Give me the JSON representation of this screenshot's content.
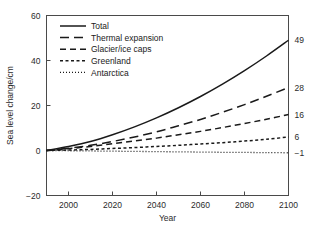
{
  "chart_data": {
    "type": "line",
    "title": "",
    "xlabel": "Year",
    "ylabel": "Sea level change/cm",
    "xlim": [
      1990,
      2100
    ],
    "ylim": [
      -20,
      60
    ],
    "grid": false,
    "legend_position": "top-left",
    "xticks": [
      2000,
      2020,
      2040,
      2060,
      2080,
      2100
    ],
    "yticks": [
      -20,
      0,
      20,
      40,
      60
    ],
    "xtick_labels": [
      "2000",
      "2020",
      "2040",
      "2060",
      "2080",
      "2100"
    ],
    "ytick_labels": [
      "-20",
      "0",
      "20",
      "40",
      "60"
    ],
    "x": [
      1990,
      2000,
      2010,
      2020,
      2030,
      2040,
      2050,
      2060,
      2070,
      2080,
      2090,
      2100
    ],
    "series": [
      {
        "name": "Total",
        "style": "solid",
        "dash": "none",
        "end_label": "49",
        "values": [
          0,
          1.8,
          4.0,
          7.0,
          10.5,
          14.5,
          19.0,
          24.0,
          29.5,
          35.5,
          42.0,
          49.0
        ]
      },
      {
        "name": "Thermal expansion",
        "style": "long-dash",
        "dash": "9,5",
        "end_label": "28",
        "values": [
          0,
          1.0,
          2.3,
          4.0,
          6.0,
          8.3,
          11.0,
          13.8,
          17.0,
          20.4,
          24.1,
          28.0
        ]
      },
      {
        "name": "Glacier/ice caps",
        "style": "medium-dash",
        "dash": "6,4",
        "end_label": "16",
        "values": [
          0,
          0.8,
          1.8,
          3.0,
          4.2,
          5.5,
          7.0,
          8.5,
          10.2,
          12.0,
          13.9,
          16.0
        ]
      },
      {
        "name": "Greenland",
        "style": "short-dash",
        "dash": "3,2.5",
        "end_label": "6",
        "values": [
          0,
          0.2,
          0.5,
          0.9,
          1.3,
          1.8,
          2.3,
          2.9,
          3.5,
          4.2,
          5.0,
          6.0
        ]
      },
      {
        "name": "Antarctica",
        "style": "dotted",
        "dash": "1,2",
        "end_label": "-1",
        "values": [
          0,
          -0.1,
          -0.2,
          -0.3,
          -0.4,
          -0.5,
          -0.6,
          -0.7,
          -0.8,
          -0.85,
          -0.95,
          -1.0
        ]
      }
    ]
  },
  "legend": {
    "items": [
      {
        "label": "Total"
      },
      {
        "label": "Thermal expansion"
      },
      {
        "label": "Glacier/ice caps"
      },
      {
        "label": "Greenland"
      },
      {
        "label": "Antarctica"
      }
    ]
  },
  "colors": {
    "line": "#1a1a1a",
    "axis": "#4a4a4a",
    "background": "#ffffff",
    "text": "#2b2b2b"
  }
}
